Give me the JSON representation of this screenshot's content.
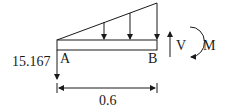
{
  "diagram": {
    "type": "free-body-diagram",
    "reaction_left": {
      "label": "15.167",
      "direction": "down"
    },
    "points": {
      "left": "A",
      "right": "B"
    },
    "internal_shear": {
      "label": "V",
      "direction": "up"
    },
    "internal_moment": {
      "label": "M",
      "direction": "clockwise"
    },
    "dimension": {
      "label": "0.6"
    },
    "distributed_load": {
      "shape": "triangular",
      "increasing_toward": "B",
      "arrow_count": 3
    }
  }
}
